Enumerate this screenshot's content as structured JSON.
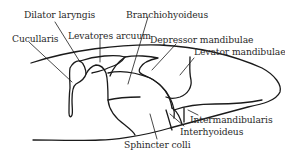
{
  "figure": {
    "type": "anatomical-diagram",
    "line_color": "#1a1a1a",
    "background": "#ffffff",
    "labels": [
      {
        "id": "dilator-laryngis",
        "text": "Dilator laryngis"
      },
      {
        "id": "branchiohyoideus",
        "text": "Branchiohyoideus"
      },
      {
        "id": "cucullaris",
        "text": "Cucullaris"
      },
      {
        "id": "levatores-arcuum",
        "text": "Levatores arcuum"
      },
      {
        "id": "depressor-mandibulae",
        "text": "Depressor mandibulae"
      },
      {
        "id": "levator-mandibulae",
        "text": "Levator mandibulae"
      },
      {
        "id": "intermandibularis",
        "text": "Intermandibularis"
      },
      {
        "id": "interhyoideus",
        "text": "Interhyoideus"
      },
      {
        "id": "sphincter-colli",
        "text": "Sphincter colli"
      }
    ]
  }
}
